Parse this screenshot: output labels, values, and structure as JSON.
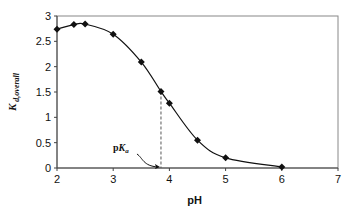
{
  "chart_data": {
    "type": "scatter",
    "title": "",
    "xlabel": "pH",
    "ylabel": "K d,overall",
    "ylabel_main": "K",
    "ylabel_sub": "d,overall",
    "xlim": [
      2,
      7
    ],
    "ylim": [
      0,
      3
    ],
    "xticks": [
      "2",
      "3",
      "4",
      "5",
      "6",
      "7"
    ],
    "yticks": [
      "0",
      "0.5",
      "1",
      "1.5",
      "2",
      "2.5",
      "3"
    ],
    "grid": false,
    "legend": null,
    "series": [
      {
        "name": "K d,overall",
        "marker": "diamond",
        "line": "smooth",
        "x": [
          2.0,
          2.3,
          2.5,
          3.0,
          3.5,
          3.85,
          4.0,
          4.5,
          5.0,
          6.0
        ],
        "y": [
          2.74,
          2.83,
          2.84,
          2.64,
          2.09,
          1.51,
          1.28,
          0.55,
          0.2,
          0.02
        ]
      }
    ],
    "annotations": [
      {
        "text": "pKa",
        "main": "p",
        "italic": "K",
        "sub": "a",
        "x": 3.85,
        "type": "dashed vertical line with arrow"
      }
    ]
  }
}
